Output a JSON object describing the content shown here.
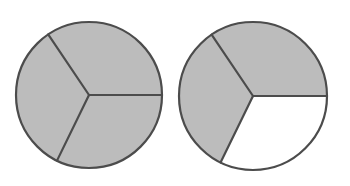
{
  "figure": {
    "background_color": "#ffffff",
    "shaded_color": "#bcbcbc",
    "unshaded_color": "#ffffff",
    "stroke_color": "#4c4c4c",
    "stroke_width": 2.2
  },
  "chart_data": {
    "type": "pie",
    "legend": "",
    "charts": [
      {
        "name": "circle-left",
        "label": "Circle 1",
        "center_x": 89,
        "center_y": 95,
        "radius": 73,
        "total_parts": 3,
        "shaded_parts": 3,
        "fraction_text": "3/3",
        "slices": [
          {
            "name": "top-sector",
            "start_angle": 0,
            "end_angle": 124,
            "sweep": 124,
            "value": 1,
            "shaded": true,
            "fill": "#bcbcbc"
          },
          {
            "name": "left-sector",
            "start_angle": 124,
            "end_angle": 244,
            "sweep": 120,
            "value": 1,
            "shaded": true,
            "fill": "#bcbcbc"
          },
          {
            "name": "bottom-right-sector",
            "start_angle": 244,
            "end_angle": 360,
            "sweep": 116,
            "value": 1,
            "shaded": true,
            "fill": "#bcbcbc"
          }
        ]
      },
      {
        "name": "circle-right",
        "label": "Circle 2",
        "center_x": 253,
        "center_y": 96,
        "radius": 74,
        "total_parts": 3,
        "shaded_parts": 2,
        "fraction_text": "2/3",
        "slices": [
          {
            "name": "top-sector",
            "start_angle": 0,
            "end_angle": 124,
            "sweep": 124,
            "value": 1,
            "shaded": true,
            "fill": "#bcbcbc"
          },
          {
            "name": "left-sector",
            "start_angle": 124,
            "end_angle": 244,
            "sweep": 120,
            "value": 1,
            "shaded": true,
            "fill": "#bcbcbc"
          },
          {
            "name": "bottom-right-sector",
            "start_angle": 244,
            "end_angle": 360,
            "sweep": 116,
            "value": 1,
            "shaded": false,
            "fill": "#ffffff"
          }
        ]
      }
    ]
  }
}
